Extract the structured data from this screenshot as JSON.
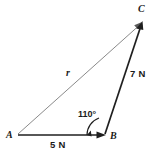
{
  "figure": {
    "type": "force-vector-triangle-diagram",
    "background_color": "#ffffff",
    "stroke_color_primary": "#1a1a1a",
    "stroke_color_resultant": "#7a7a7a",
    "vertices": [
      {
        "name": "A",
        "label": "A",
        "x": 18,
        "y": 135
      },
      {
        "name": "B",
        "label": "B",
        "x": 105,
        "y": 135
      },
      {
        "name": "C",
        "label": "C",
        "x": 142,
        "y": 22
      }
    ],
    "vectors": [
      {
        "name": "vector-AB",
        "from": "A",
        "to": "B",
        "magnitude_label": "5 N",
        "value": 5,
        "unit": "N",
        "arrowhead": "at-B",
        "style": "solid-dark"
      },
      {
        "name": "vector-BC",
        "from": "B",
        "to": "C",
        "magnitude_label": "7 N",
        "value": 7,
        "unit": "N",
        "arrowhead": "at-C",
        "style": "solid-dark"
      },
      {
        "name": "vector-AC-resultant",
        "from": "A",
        "to": "C",
        "magnitude_label": "r",
        "unit": "",
        "arrowhead": "at-C",
        "style": "thin-gray"
      }
    ],
    "angle": {
      "name": "angle-at-B",
      "label": "110°",
      "value": 110,
      "unit": "degrees",
      "at_vertex": "B",
      "between": [
        "vector-BA-direction",
        "vector-BC"
      ]
    }
  }
}
